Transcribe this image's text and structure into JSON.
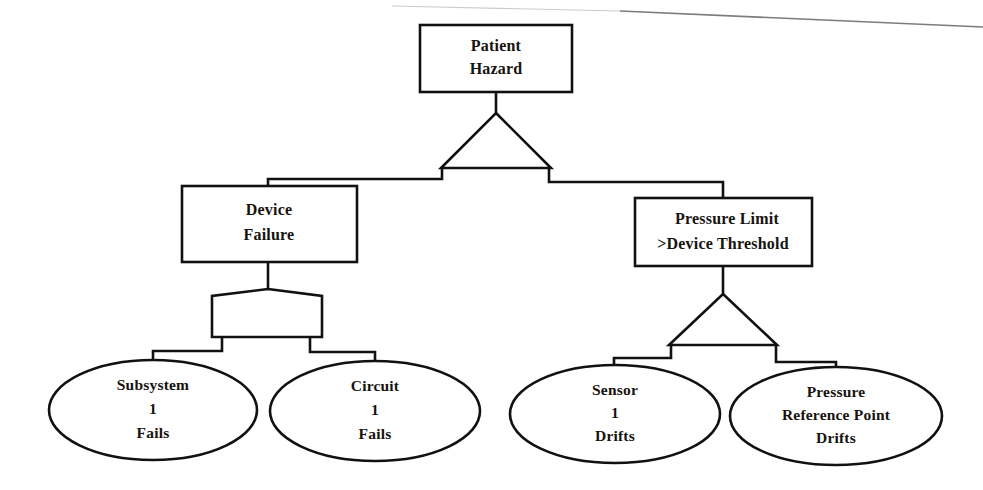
{
  "diagram": {
    "kind": "fault-tree",
    "background_color": "#ffffff",
    "line_color": "#111111",
    "text_color": "#17130f",
    "width": 983,
    "height": 490
  },
  "nodes": {
    "top_event": {
      "shape": "rectangle",
      "line1": "Patient",
      "line2": "Hazard"
    },
    "device_failure": {
      "shape": "rectangle",
      "line1": "Device",
      "line2": "Failure"
    },
    "pressure_limit": {
      "shape": "rectangle",
      "line1": "Pressure Limit",
      "line2": ">Device Threshold"
    }
  },
  "gates": {
    "top_gate": {
      "shape": "triangle"
    },
    "device_gate": {
      "shape": "pentagon"
    },
    "pressure_gate": {
      "shape": "triangle"
    }
  },
  "leaves": [
    {
      "id": "subsystem-1-fails",
      "shape": "ellipse",
      "line1": "Subsystem",
      "line2": "1",
      "line3": "Fails"
    },
    {
      "id": "circuit-1-fails",
      "shape": "ellipse",
      "line1": "Circuit",
      "line2": "1",
      "line3": "Fails"
    },
    {
      "id": "sensor-1-drifts",
      "shape": "ellipse",
      "line1": "Sensor",
      "line2": "1",
      "line3": "Drifts"
    },
    {
      "id": "pressure-reference-point-drifts",
      "shape": "ellipse",
      "line1": "Pressure",
      "line2": "Reference Point",
      "line3": "Drifts"
    }
  ]
}
